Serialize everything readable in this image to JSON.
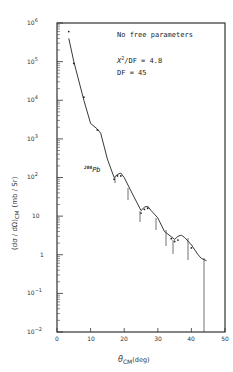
{
  "chart_data": {
    "type": "line",
    "title": "",
    "xlabel": "θ_CM (deg)",
    "ylabel": "(dσ/dΩ)_CM (mb/Sr)",
    "xlim": [
      0,
      50
    ],
    "ylim": [
      0.01,
      1000000
    ],
    "yscale": "log",
    "grid": false,
    "legend": null,
    "x_ticks": [
      "0",
      "10",
      "20",
      "30",
      "40",
      "50"
    ],
    "y_ticks": [
      "10^-2",
      "10^-1",
      "1",
      "10",
      "10^2",
      "10^3",
      "10^4",
      "10^5",
      "10^6"
    ],
    "annotations": {
      "note": "No free parameters",
      "chi2": "χ²/DF = 4.8",
      "df": "DF = 45",
      "target": "208Pb"
    },
    "series": [
      {
        "name": "theory",
        "x": [
          3.5,
          5,
          8,
          10,
          12,
          13,
          15,
          17,
          18,
          19,
          20,
          22,
          25,
          26,
          27,
          28,
          30,
          32,
          35,
          36,
          37,
          38,
          40,
          42,
          43,
          44.5
        ],
        "y": [
          400000,
          100000,
          10000,
          2500,
          1800,
          1400,
          300,
          100,
          120,
          130,
          100,
          45,
          14,
          17,
          18,
          14,
          9,
          4,
          2.5,
          3,
          3.2,
          2.8,
          1.8,
          1.0,
          0.8,
          0.7
        ]
      },
      {
        "name": "data",
        "x": [
          3.5,
          5,
          8,
          12,
          17,
          18,
          19,
          25,
          26,
          27,
          34,
          35,
          36,
          40
        ],
        "y": [
          600000,
          90000,
          12000,
          1700,
          90,
          110,
          110,
          12,
          15,
          16,
          2.6,
          2.2,
          2.4,
          1.5
        ]
      }
    ]
  },
  "labels": {
    "note": "No free parameters",
    "chi2_symbol": "X",
    "chi2_sup": "2",
    "chi2_rest": "/DF = 4.8",
    "df": "DF = 45",
    "target_sup": "208",
    "target": "Pb",
    "xlabel_theta": "θ",
    "xlabel_sub": "CM",
    "xlabel_unit": "(deg)",
    "ylabel_main": "(dσ / dΩ)",
    "ylabel_sub": "CM",
    "ylabel_unit": "(mb / Sr)",
    "x_ticks": [
      "0",
      "10",
      "20",
      "30",
      "40",
      "50"
    ],
    "y_ticks": [
      "10",
      "10",
      "10",
      "10",
      "10",
      "10",
      "1",
      "10",
      "10"
    ],
    "y_exps": [
      "6",
      "5",
      "4",
      "3",
      "2",
      "",
      "",
      "−1",
      "−2"
    ]
  }
}
